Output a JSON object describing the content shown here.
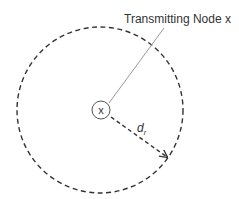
{
  "diagram": {
    "title_label": "Transmitting Node x",
    "node_label": "x",
    "radius_label_main": "d",
    "radius_label_sub": "r",
    "colors": {
      "stroke": "#333333",
      "leader": "#999999",
      "background": "#ffffff"
    }
  }
}
